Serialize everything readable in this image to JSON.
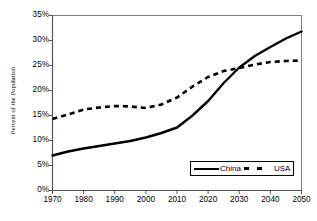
{
  "chart_data": {
    "type": "line",
    "title": "",
    "xlabel": "",
    "ylabel": "Percent of the Population",
    "xlim": [
      1970,
      2050
    ],
    "ylim": [
      0,
      35
    ],
    "grid": false,
    "legend_position": "bottom-right",
    "x_ticks": [
      "1970",
      "1980",
      "1990",
      "2000",
      "2010",
      "2020",
      "2030",
      "2040",
      "2050"
    ],
    "y_ticks": [
      "0%",
      "5%",
      "10%",
      "15%",
      "20%",
      "25%",
      "30%",
      "35%"
    ],
    "x": [
      1970,
      1975,
      1980,
      1985,
      1990,
      1995,
      2000,
      2005,
      2010,
      2015,
      2020,
      2025,
      2030,
      2035,
      2040,
      2045,
      2050
    ],
    "series": [
      {
        "name": "China",
        "style": "solid",
        "color": "#000000",
        "values": [
          7.0,
          7.8,
          8.4,
          8.9,
          9.4,
          9.9,
          10.6,
          11.5,
          12.6,
          15.0,
          17.9,
          21.5,
          24.6,
          26.9,
          28.7,
          30.4,
          31.8
        ]
      },
      {
        "name": "USA",
        "style": "dashed",
        "color": "#000000",
        "values": [
          14.3,
          15.2,
          16.2,
          16.6,
          16.9,
          16.8,
          16.5,
          17.2,
          18.6,
          20.8,
          22.7,
          23.9,
          24.5,
          25.2,
          25.7,
          25.9,
          26.0
        ]
      }
    ]
  },
  "legend": {
    "china_label": "China",
    "usa_label": "USA"
  }
}
